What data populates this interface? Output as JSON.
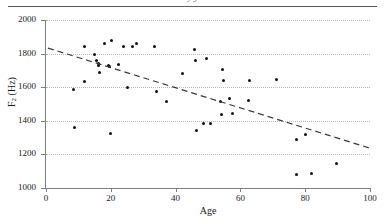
{
  "figure": {
    "clipped_caption_above": "y g",
    "xlabel": "Age",
    "ylabel_prefix": "F",
    "ylabel_sub": "2",
    "ylabel_suffix": " (Hz)"
  },
  "chart_data": {
    "type": "scatter",
    "title": "",
    "xlabel": "Age",
    "ylabel": "F2 (Hz)",
    "xlim": [
      0,
      100
    ],
    "ylim": [
      1000,
      2000
    ],
    "xticks": [
      0,
      20,
      40,
      60,
      80,
      100
    ],
    "yticks": [
      1000,
      1200,
      1400,
      1600,
      1800,
      2000
    ],
    "xtick_labels": [
      "0",
      "20",
      "40",
      "60",
      "80",
      "100"
    ],
    "ytick_labels": [
      "1000",
      "1200",
      "1400",
      "1600",
      "1800",
      "2000"
    ],
    "grid": "horizontal-dotted",
    "legend": null,
    "marker": "filled-circle",
    "marker_color": "#111111",
    "points": [
      {
        "x": 8.5,
        "y": 1588
      },
      {
        "x": 8.8,
        "y": 1358
      },
      {
        "x": 11.8,
        "y": 1841
      },
      {
        "x": 12.0,
        "y": 1631
      },
      {
        "x": 15.0,
        "y": 1795
      },
      {
        "x": 15.6,
        "y": 1758
      },
      {
        "x": 16.2,
        "y": 1740
      },
      {
        "x": 16.3,
        "y": 1732
      },
      {
        "x": 16.6,
        "y": 1688
      },
      {
        "x": 18.0,
        "y": 1861
      },
      {
        "x": 19.4,
        "y": 1731
      },
      {
        "x": 19.6,
        "y": 1724
      },
      {
        "x": 19.8,
        "y": 1325
      },
      {
        "x": 20.2,
        "y": 1879
      },
      {
        "x": 22.4,
        "y": 1737
      },
      {
        "x": 23.8,
        "y": 1841
      },
      {
        "x": 25.2,
        "y": 1596
      },
      {
        "x": 26.6,
        "y": 1840
      },
      {
        "x": 28.0,
        "y": 1859
      },
      {
        "x": 33.6,
        "y": 1841
      },
      {
        "x": 34.0,
        "y": 1577
      },
      {
        "x": 37.2,
        "y": 1516
      },
      {
        "x": 42.0,
        "y": 1679
      },
      {
        "x": 45.8,
        "y": 1824
      },
      {
        "x": 46.2,
        "y": 1757
      },
      {
        "x": 46.4,
        "y": 1345
      },
      {
        "x": 48.6,
        "y": 1385
      },
      {
        "x": 49.6,
        "y": 1770
      },
      {
        "x": 50.8,
        "y": 1384
      },
      {
        "x": 53.8,
        "y": 1513
      },
      {
        "x": 54.2,
        "y": 1440
      },
      {
        "x": 54.6,
        "y": 1707
      },
      {
        "x": 54.8,
        "y": 1642
      },
      {
        "x": 56.6,
        "y": 1534
      },
      {
        "x": 57.6,
        "y": 1443
      },
      {
        "x": 62.4,
        "y": 1521
      },
      {
        "x": 62.8,
        "y": 1638
      },
      {
        "x": 71.0,
        "y": 1643
      },
      {
        "x": 77.2,
        "y": 1290
      },
      {
        "x": 77.4,
        "y": 1081
      },
      {
        "x": 80.0,
        "y": 1320
      },
      {
        "x": 82.0,
        "y": 1086
      },
      {
        "x": 89.8,
        "y": 1143
      }
    ],
    "trendline": {
      "style": "dashed",
      "color": "#3a3a3a",
      "x0": 0.6,
      "y0": 1833,
      "x1": 100.0,
      "y1": 1237
    }
  }
}
